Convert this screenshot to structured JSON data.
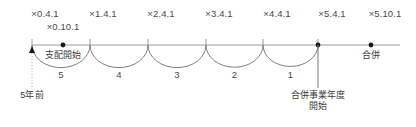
{
  "figure": {
    "type": "timeline-diagram",
    "width": 416,
    "height": 127,
    "axis_color": "#9a9a9a",
    "arc_color": "#6f6f6f",
    "text_color": "#4a4a4a",
    "marker_color": "#1a1a1a",
    "background": "#ffffff",
    "axis_y": 45,
    "axis_start_x": 32,
    "axis_end_x": 400
  },
  "top_labels": [
    {
      "text": "×0.4.1",
      "x": 45,
      "row": 1
    },
    {
      "text": "×0.10.1",
      "x": 63,
      "row": 2
    },
    {
      "text": "×1.4.1",
      "x": 103,
      "row": 1
    },
    {
      "text": "×2.4.1",
      "x": 161,
      "row": 1
    },
    {
      "text": "×3.4.1",
      "x": 219,
      "row": 1
    },
    {
      "text": "×4.4.1",
      "x": 277,
      "row": 1
    },
    {
      "text": "×5.4.1",
      "x": 332,
      "row": 1
    },
    {
      "text": "×5.10.1",
      "x": 385,
      "row": 1
    }
  ],
  "ticks": [
    {
      "x": 32
    },
    {
      "x": 90
    },
    {
      "x": 148
    },
    {
      "x": 206
    },
    {
      "x": 263
    },
    {
      "x": 318
    }
  ],
  "dots": [
    {
      "x": 63,
      "name": "control-start-dot"
    },
    {
      "x": 318,
      "name": "merger-fiscal-year-start-dot"
    },
    {
      "x": 371,
      "name": "merger-dot"
    }
  ],
  "arcs": [
    {
      "from": 32,
      "to": 90,
      "number": "5"
    },
    {
      "from": 90,
      "to": 148,
      "number": "4"
    },
    {
      "from": 148,
      "to": 206,
      "number": "3"
    },
    {
      "from": 206,
      "to": 263,
      "number": "2"
    },
    {
      "from": 263,
      "to": 318,
      "number": "1"
    }
  ],
  "annotations": {
    "control_start": {
      "text": "支配開始",
      "x": 63
    },
    "merger": {
      "text": "合併",
      "x": 371
    },
    "five_years_ago": {
      "text": "5年前",
      "x": 32
    },
    "merger_fiscal_year_start_line1": {
      "text": "合併事業年度",
      "x": 318
    },
    "merger_fiscal_year_start_line2": {
      "text": "開始",
      "x": 318
    }
  }
}
